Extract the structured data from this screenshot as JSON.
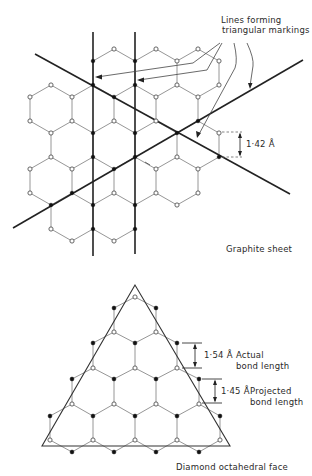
{
  "figure": {
    "graphite": {
      "caption": "Graphite sheet",
      "callout": {
        "line1": "Lines forming",
        "line2": "triangular markings"
      },
      "dimension_label": "1·42 Å",
      "lattice": {
        "x0": 30,
        "dx": 21,
        "rows": [
          {
            "y": 49,
            "cols": [
              4,
              6,
              8
            ]
          },
          {
            "y": 61,
            "cols": [
              3,
              5,
              7,
              9
            ]
          },
          {
            "y": 85,
            "cols": [
              1,
              3,
              5,
              7,
              9
            ]
          },
          {
            "y": 97,
            "cols": [
              0,
              2,
              4,
              6,
              8
            ]
          },
          {
            "y": 121,
            "cols": [
              0,
              2,
              4,
              6,
              8,
              9.99
            ]
          },
          {
            "y": 133,
            "cols": [
              1,
              3,
              5,
              7,
              9
            ]
          },
          {
            "y": 157,
            "cols": [
              1,
              3,
              5,
              7,
              9
            ]
          },
          {
            "y": 169,
            "cols": [
              0,
              2,
              4,
              6,
              8
            ]
          },
          {
            "y": 193,
            "cols": [
              0,
              2,
              4,
              6,
              8
            ]
          },
          {
            "y": 205,
            "cols": [
              1,
              3,
              5,
              7
            ]
          },
          {
            "y": 229,
            "cols": [
              1,
              3,
              5
            ]
          },
          {
            "y": 241,
            "cols": [
              2,
              4
            ]
          }
        ],
        "filled_nodes": [
          [
            93,
            61
          ],
          [
            135,
            61
          ],
          [
            93,
            85
          ],
          [
            135,
            85
          ],
          [
            93,
            133
          ],
          [
            135,
            133
          ],
          [
            114,
            97
          ],
          [
            177,
            133
          ],
          [
            199,
            121
          ],
          [
            135,
            157
          ],
          [
            114,
            169
          ],
          [
            72,
            193
          ],
          [
            51,
            205
          ],
          [
            93,
            205
          ],
          [
            135,
            205
          ],
          [
            93,
            229
          ],
          [
            135,
            229
          ],
          [
            93,
            157
          ],
          [
            220,
            157
          ]
        ]
      },
      "heavy_lines": [
        {
          "x1": 93,
          "y1": 32,
          "x2": 93,
          "y2": 256
        },
        {
          "x1": 135,
          "y1": 32,
          "x2": 135,
          "y2": 254
        },
        {
          "x1": 35,
          "y1": 54,
          "x2": 290,
          "y2": 194
        },
        {
          "x1": 13,
          "y1": 228,
          "x2": 303,
          "y2": 60
        }
      ]
    },
    "diamond": {
      "caption": "Diamond octahedral face",
      "actual": {
        "value": "1·54 Å",
        "text1": "Actual",
        "text2": "bond length"
      },
      "projected": {
        "value": "1·45 Å",
        "text1": "Projected",
        "text2": "bond length"
      },
      "triangle": [
        [
          135,
          285
        ],
        [
          42,
          446
        ],
        [
          230,
          446
        ]
      ],
      "open_atoms": [
        [
          135,
          297
        ],
        [
          114,
          332
        ],
        [
          156,
          332
        ],
        [
          93,
          368
        ],
        [
          135,
          368
        ],
        [
          177,
          368
        ],
        [
          72,
          404
        ],
        [
          114,
          404
        ],
        [
          156,
          404
        ],
        [
          199,
          404
        ],
        [
          50,
          440
        ],
        [
          93,
          440
        ],
        [
          135,
          440
        ],
        [
          177,
          440
        ],
        [
          220,
          440
        ]
      ],
      "filled_atoms": [
        [
          114,
          308
        ],
        [
          156,
          308
        ],
        [
          93,
          343
        ],
        [
          135,
          343
        ],
        [
          177,
          343
        ],
        [
          72,
          379
        ],
        [
          114,
          379
        ],
        [
          156,
          379
        ],
        [
          199,
          379
        ],
        [
          50,
          416
        ],
        [
          93,
          416
        ],
        [
          135,
          416
        ],
        [
          177,
          416
        ],
        [
          220,
          416
        ],
        [
          72,
          452
        ],
        [
          114,
          452
        ],
        [
          156,
          452
        ],
        [
          199,
          452
        ]
      ]
    }
  }
}
